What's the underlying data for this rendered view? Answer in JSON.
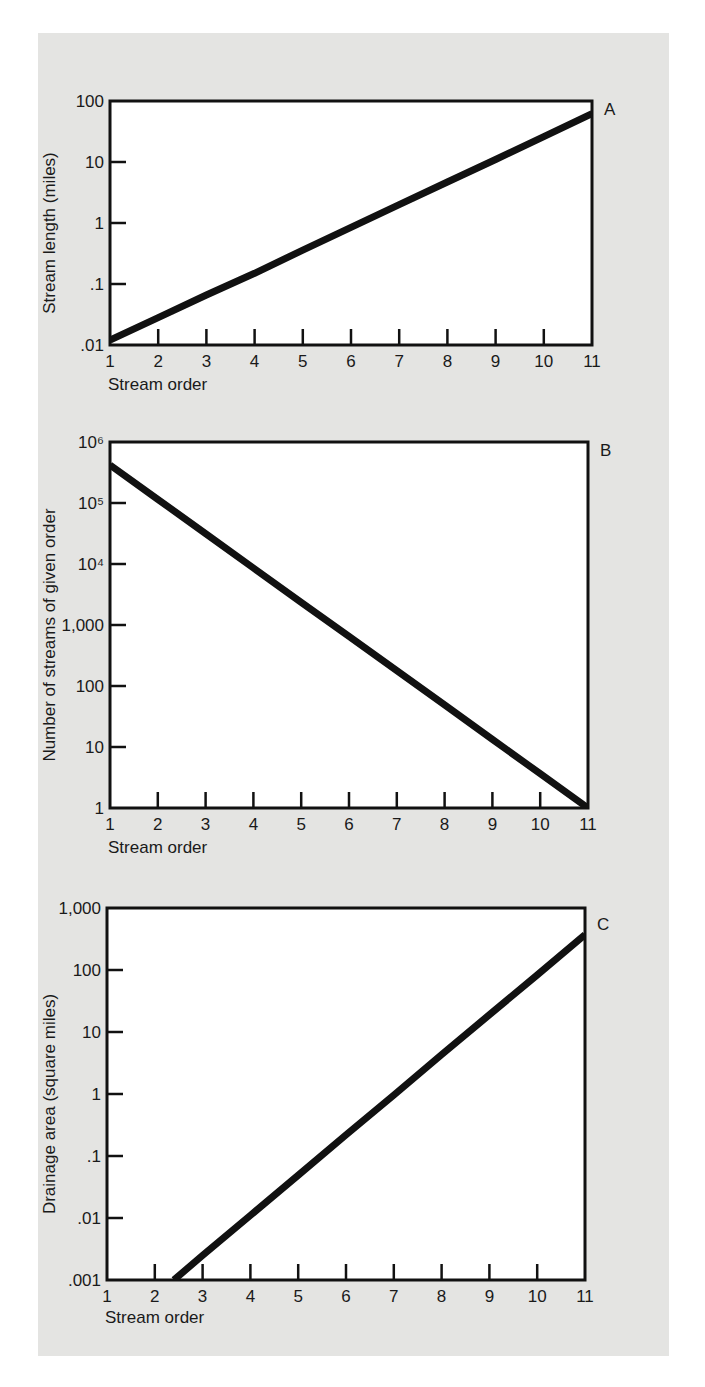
{
  "figure": {
    "background_color": "#e4e4e2",
    "plot_color": "#ffffff",
    "line_color": "#111111"
  },
  "panels": [
    {
      "letter": "A",
      "xlabel": "Stream order",
      "ylabel": "Stream length (miles)",
      "y_ticks": [
        "100",
        "10",
        "1",
        ".1",
        ".01"
      ],
      "x_ticks": [
        "1",
        "2",
        "3",
        "4",
        "5",
        "6",
        "7",
        "8",
        "9",
        "10",
        "11"
      ]
    },
    {
      "letter": "B",
      "xlabel": "Stream order",
      "ylabel": "Number of streams of given order",
      "y_ticks": [
        "10⁶",
        "10⁵",
        "10⁴",
        "1,000",
        "100",
        "10",
        "1"
      ],
      "x_ticks": [
        "1",
        "2",
        "3",
        "4",
        "5",
        "6",
        "7",
        "8",
        "9",
        "10",
        "11"
      ]
    },
    {
      "letter": "C",
      "xlabel": "Stream order",
      "ylabel": "Drainage area (square miles)",
      "y_ticks": [
        "1,000",
        "100",
        "10",
        "1",
        ".1",
        ".01",
        ".001"
      ],
      "x_ticks": [
        "1",
        "2",
        "3",
        "4",
        "5",
        "6",
        "7",
        "8",
        "9",
        "10",
        "11"
      ]
    }
  ],
  "chart_data": [
    {
      "type": "line",
      "title": "A",
      "xlabel": "Stream order",
      "ylabel": "Stream length (miles)",
      "yscale": "log",
      "xlim": [
        1,
        11
      ],
      "ylim": [
        0.01,
        100
      ],
      "grid": false,
      "x": [
        1,
        2,
        3,
        4,
        5,
        6,
        7,
        8,
        9,
        10,
        11
      ],
      "series": [
        {
          "name": "Stream length",
          "values": [
            0.012,
            0.028,
            0.066,
            0.15,
            0.36,
            0.85,
            2.0,
            4.7,
            11,
            26,
            62
          ]
        }
      ]
    },
    {
      "type": "line",
      "title": "B",
      "xlabel": "Stream order",
      "ylabel": "Number of streams of given order",
      "yscale": "log",
      "xlim": [
        1,
        11
      ],
      "ylim": [
        1,
        1000000
      ],
      "grid": false,
      "x": [
        1,
        2,
        3,
        4,
        5,
        6,
        7,
        8,
        9,
        10,
        11
      ],
      "series": [
        {
          "name": "Number of streams",
          "values": [
            420000,
            115000,
            31500,
            8600,
            2360,
            650,
            178,
            49,
            13.3,
            3.65,
            1
          ]
        }
      ]
    },
    {
      "type": "line",
      "title": "C",
      "xlabel": "Stream order",
      "ylabel": "Drainage area (square miles)",
      "yscale": "log",
      "xlim": [
        1,
        11
      ],
      "ylim": [
        0.001,
        1000
      ],
      "grid": false,
      "x": [
        2.4,
        3,
        4,
        5,
        6,
        7,
        8,
        9,
        10,
        11
      ],
      "series": [
        {
          "name": "Drainage area",
          "values": [
            0.001,
            0.0025,
            0.011,
            0.049,
            0.22,
            0.96,
            4.3,
            19,
            83,
            370
          ]
        }
      ]
    }
  ]
}
